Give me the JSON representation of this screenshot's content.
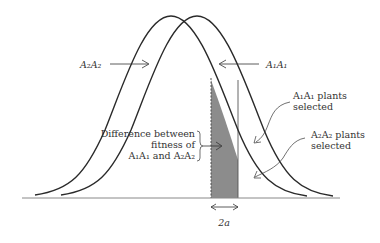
{
  "diagram": {
    "labels": {
      "a2a2_curve": "A₂A₂",
      "a1a1_curve": "A₁A₁",
      "a1a1_selected_line1": "A₁A₁ plants",
      "a1a1_selected_line2": "selected",
      "a2a2_selected_line1": "A₂A₂ plants",
      "a2a2_selected_line2": "selected",
      "difference_line1": "Difference between",
      "difference_line2": "fitness of",
      "difference_line3": "A₁A₁ and A₂A₂",
      "shift": "2a"
    },
    "colors": {
      "curve": "#2a2a2a",
      "shade": "#8c8c8c",
      "axis": "#888888",
      "text": "#333333"
    }
  }
}
